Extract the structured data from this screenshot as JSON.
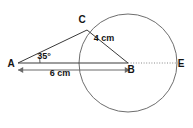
{
  "figure": {
    "background_color": "#ffffff",
    "width": 193,
    "height": 128,
    "points": {
      "A": {
        "label": "A",
        "x": 18,
        "y": 63,
        "label_x": 11,
        "label_y": 67,
        "description": "external point left of circle"
      },
      "B": {
        "label": "B",
        "x": 128,
        "y": 63,
        "label_x": 131,
        "label_y": 73,
        "description": "centre of circle"
      },
      "C": {
        "label": "C",
        "x": 87,
        "y": 30,
        "label_x": 82,
        "label_y": 23,
        "description": "point on circle, upper left"
      },
      "E": {
        "label": "E",
        "x": 177,
        "y": 63,
        "label_x": 181,
        "label_y": 67,
        "description": "point on circle, right end of diameter line"
      }
    },
    "circle": {
      "center_x": 128,
      "center_y": 63,
      "radius": 49,
      "stroke_color": "#6e6e6e"
    },
    "segments": [
      {
        "name": "AC",
        "from": "A",
        "to": "C",
        "style": "solid",
        "color": "#3a3a3a"
      },
      {
        "name": "AB",
        "from": "A",
        "to": "B",
        "style": "solid",
        "color": "#3a3a3a"
      },
      {
        "name": "CB",
        "from": "C",
        "to": "B",
        "style": "solid",
        "color": "#3a3a3a"
      },
      {
        "name": "BE",
        "from": "B",
        "to": "E",
        "style": "dotted",
        "color": "#8a8a8a"
      }
    ],
    "labels": {
      "radius_cb": "4 cm",
      "distance_ab": "6 cm",
      "angle_at_a": "35°"
    },
    "label_positions": {
      "radius_cb": {
        "x": 104,
        "y": 41
      },
      "distance_ab": {
        "x": 60,
        "y": 76
      },
      "angle_at_a": {
        "x": 44,
        "y": 59
      }
    },
    "dimension_line": {
      "name": "AB-dimension",
      "y": 70,
      "x_start": 18,
      "x_end": 130,
      "arrowheads": "both",
      "color": "#6a6a6a"
    },
    "angle_arc": {
      "vertex": "A",
      "radius": 22,
      "start_deg": -17,
      "end_deg": 0,
      "color": "#4a4a4a"
    }
  }
}
